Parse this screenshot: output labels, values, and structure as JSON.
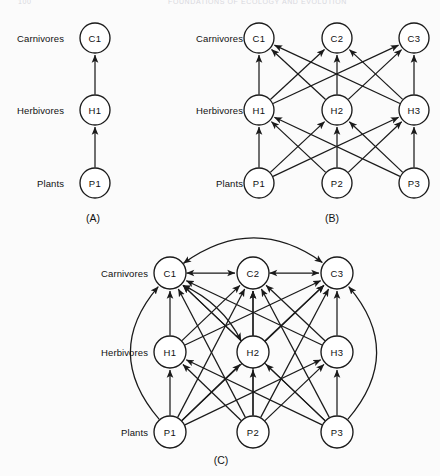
{
  "page": {
    "header_left": "100",
    "header_center": "FOUNDATIONS OF ECOLOGY AND EVOLUTION"
  },
  "figure": {
    "background_color": "#fbfbfb",
    "ink_color": "#1a1a1a",
    "node_fill": "#ffffff"
  },
  "trophic_levels": [
    {
      "key": "carnivores",
      "label": "Carnivores"
    },
    {
      "key": "herbivores",
      "label": "Herbivores"
    },
    {
      "key": "plants",
      "label": "Plants"
    }
  ],
  "panels": [
    {
      "id": "A",
      "caption": "(A)",
      "caption_x": 93,
      "caption_y": 218,
      "label_x": 64,
      "row_y": {
        "carnivores": 38,
        "herbivores": 110,
        "plants": 183
      },
      "node_radius": 15,
      "row_labels": [
        {
          "text": "Carnivores",
          "x": 64,
          "y": 38
        },
        {
          "text": "Herbivores",
          "x": 64,
          "y": 110
        },
        {
          "text": "Plants",
          "x": 64,
          "y": 183
        }
      ],
      "nodes": [
        {
          "id": "C1",
          "label": "C1",
          "x": 95,
          "y": 38,
          "level": "carnivores"
        },
        {
          "id": "H1",
          "label": "H1",
          "x": 95,
          "y": 110,
          "level": "herbivores"
        },
        {
          "id": "P1",
          "label": "P1",
          "x": 95,
          "y": 183,
          "level": "plants"
        }
      ],
      "links": [
        {
          "from": "P1",
          "to": "H1",
          "kind": "straight"
        },
        {
          "from": "H1",
          "to": "C1",
          "kind": "straight"
        }
      ],
      "arcs": []
    },
    {
      "id": "B",
      "caption": "(B)",
      "caption_x": 332,
      "caption_y": 218,
      "label_x": 243,
      "row_y": {
        "carnivores": 38,
        "herbivores": 110,
        "plants": 183
      },
      "node_radius": 15,
      "row_labels": [
        {
          "text": "Carnivores",
          "x": 243,
          "y": 38
        },
        {
          "text": "Herbivores",
          "x": 243,
          "y": 110
        },
        {
          "text": "Plants",
          "x": 243,
          "y": 183
        }
      ],
      "nodes": [
        {
          "id": "C1",
          "label": "C1",
          "x": 259,
          "y": 38,
          "level": "carnivores"
        },
        {
          "id": "C2",
          "label": "C2",
          "x": 337,
          "y": 38,
          "level": "carnivores"
        },
        {
          "id": "C3",
          "label": "C3",
          "x": 414,
          "y": 38,
          "level": "carnivores"
        },
        {
          "id": "H1",
          "label": "H1",
          "x": 259,
          "y": 110,
          "level": "herbivores"
        },
        {
          "id": "H2",
          "label": "H2",
          "x": 337,
          "y": 110,
          "level": "herbivores"
        },
        {
          "id": "H3",
          "label": "H3",
          "x": 414,
          "y": 110,
          "level": "herbivores"
        },
        {
          "id": "P1",
          "label": "P1",
          "x": 259,
          "y": 183,
          "level": "plants"
        },
        {
          "id": "P2",
          "label": "P2",
          "x": 337,
          "y": 183,
          "level": "plants"
        },
        {
          "id": "P3",
          "label": "P3",
          "x": 414,
          "y": 183,
          "level": "plants"
        }
      ],
      "links": [
        {
          "from": "P1",
          "to": "H1",
          "kind": "straight"
        },
        {
          "from": "P1",
          "to": "H2",
          "kind": "straight"
        },
        {
          "from": "P1",
          "to": "H3",
          "kind": "straight"
        },
        {
          "from": "P2",
          "to": "H1",
          "kind": "straight"
        },
        {
          "from": "P2",
          "to": "H2",
          "kind": "straight"
        },
        {
          "from": "P2",
          "to": "H3",
          "kind": "straight"
        },
        {
          "from": "P3",
          "to": "H1",
          "kind": "straight"
        },
        {
          "from": "P3",
          "to": "H2",
          "kind": "straight"
        },
        {
          "from": "P3",
          "to": "H3",
          "kind": "straight"
        },
        {
          "from": "H1",
          "to": "C1",
          "kind": "straight"
        },
        {
          "from": "H1",
          "to": "C2",
          "kind": "straight"
        },
        {
          "from": "H1",
          "to": "C3",
          "kind": "straight"
        },
        {
          "from": "H2",
          "to": "C1",
          "kind": "straight"
        },
        {
          "from": "H2",
          "to": "C2",
          "kind": "straight"
        },
        {
          "from": "H2",
          "to": "C3",
          "kind": "straight"
        },
        {
          "from": "H3",
          "to": "C1",
          "kind": "straight"
        },
        {
          "from": "H3",
          "to": "C2",
          "kind": "straight"
        },
        {
          "from": "H3",
          "to": "C3",
          "kind": "straight"
        }
      ],
      "arcs": []
    },
    {
      "id": "C",
      "caption": "(C)",
      "caption_x": 221,
      "caption_y": 460,
      "label_x": 148,
      "row_y": {
        "carnivores": 273,
        "herbivores": 352,
        "plants": 432
      },
      "node_radius": 16,
      "row_labels": [
        {
          "text": "Carnivores",
          "x": 148,
          "y": 273
        },
        {
          "text": "Herbivores",
          "x": 148,
          "y": 352
        },
        {
          "text": "Plants",
          "x": 148,
          "y": 432
        }
      ],
      "nodes": [
        {
          "id": "C1",
          "label": "C1",
          "x": 170,
          "y": 273,
          "level": "carnivores"
        },
        {
          "id": "C2",
          "label": "C2",
          "x": 253,
          "y": 273,
          "level": "carnivores"
        },
        {
          "id": "C3",
          "label": "C3",
          "x": 337,
          "y": 273,
          "level": "carnivores"
        },
        {
          "id": "H1",
          "label": "H1",
          "x": 170,
          "y": 352,
          "level": "herbivores"
        },
        {
          "id": "H2",
          "label": "H2",
          "x": 253,
          "y": 352,
          "level": "herbivores"
        },
        {
          "id": "H3",
          "label": "H3",
          "x": 337,
          "y": 352,
          "level": "herbivores"
        },
        {
          "id": "P1",
          "label": "P1",
          "x": 170,
          "y": 432,
          "level": "plants"
        },
        {
          "id": "P2",
          "label": "P2",
          "x": 253,
          "y": 432,
          "level": "plants"
        },
        {
          "id": "P3",
          "label": "P3",
          "x": 337,
          "y": 432,
          "level": "plants"
        }
      ],
      "links": [
        {
          "from": "P1",
          "to": "H1",
          "kind": "straight"
        },
        {
          "from": "P1",
          "to": "H2",
          "kind": "straight"
        },
        {
          "from": "P1",
          "to": "H3",
          "kind": "straight"
        },
        {
          "from": "P2",
          "to": "H1",
          "kind": "straight"
        },
        {
          "from": "P2",
          "to": "H2",
          "kind": "straight"
        },
        {
          "from": "P2",
          "to": "H3",
          "kind": "straight"
        },
        {
          "from": "P3",
          "to": "H1",
          "kind": "straight"
        },
        {
          "from": "P3",
          "to": "H2",
          "kind": "straight"
        },
        {
          "from": "P3",
          "to": "H3",
          "kind": "straight"
        },
        {
          "from": "H1",
          "to": "C1",
          "kind": "straight"
        },
        {
          "from": "H1",
          "to": "C2",
          "kind": "straight"
        },
        {
          "from": "H1",
          "to": "C3",
          "kind": "straight"
        },
        {
          "from": "H2",
          "to": "C1",
          "kind": "straight"
        },
        {
          "from": "H2",
          "to": "C2",
          "kind": "straight"
        },
        {
          "from": "H2",
          "to": "C3",
          "kind": "straight"
        },
        {
          "from": "H3",
          "to": "C1",
          "kind": "straight"
        },
        {
          "from": "H3",
          "to": "C2",
          "kind": "straight"
        },
        {
          "from": "H3",
          "to": "C3",
          "kind": "straight"
        },
        {
          "from": "P1",
          "to": "C2",
          "kind": "straight"
        },
        {
          "from": "P1",
          "to": "C3",
          "kind": "straight"
        },
        {
          "from": "P2",
          "to": "C1",
          "kind": "straight"
        },
        {
          "from": "P2",
          "to": "C2",
          "kind": "straight"
        },
        {
          "from": "P2",
          "to": "C3",
          "kind": "straight"
        },
        {
          "from": "P3",
          "to": "C1",
          "kind": "straight"
        },
        {
          "from": "P3",
          "to": "C2",
          "kind": "straight"
        },
        {
          "from": "C1",
          "to": "C2",
          "kind": "straight",
          "bidirectional": true
        },
        {
          "from": "C2",
          "to": "C3",
          "kind": "straight",
          "bidirectional": true
        },
        {
          "from": "H2",
          "to": "C1",
          "kind": "arcpair",
          "sweep": 1,
          "bow": 14,
          "bidirectional": true
        }
      ],
      "arcs": [
        {
          "from": "P1",
          "to": "C1",
          "bow": -34,
          "note": "outer-left-bypass"
        },
        {
          "from": "P3",
          "to": "C3",
          "bow": 34,
          "note": "outer-right-bypass"
        },
        {
          "from": "C1",
          "to": "C3",
          "bow": -30,
          "bidirectional": true,
          "note": "top-overarch"
        }
      ]
    }
  ]
}
